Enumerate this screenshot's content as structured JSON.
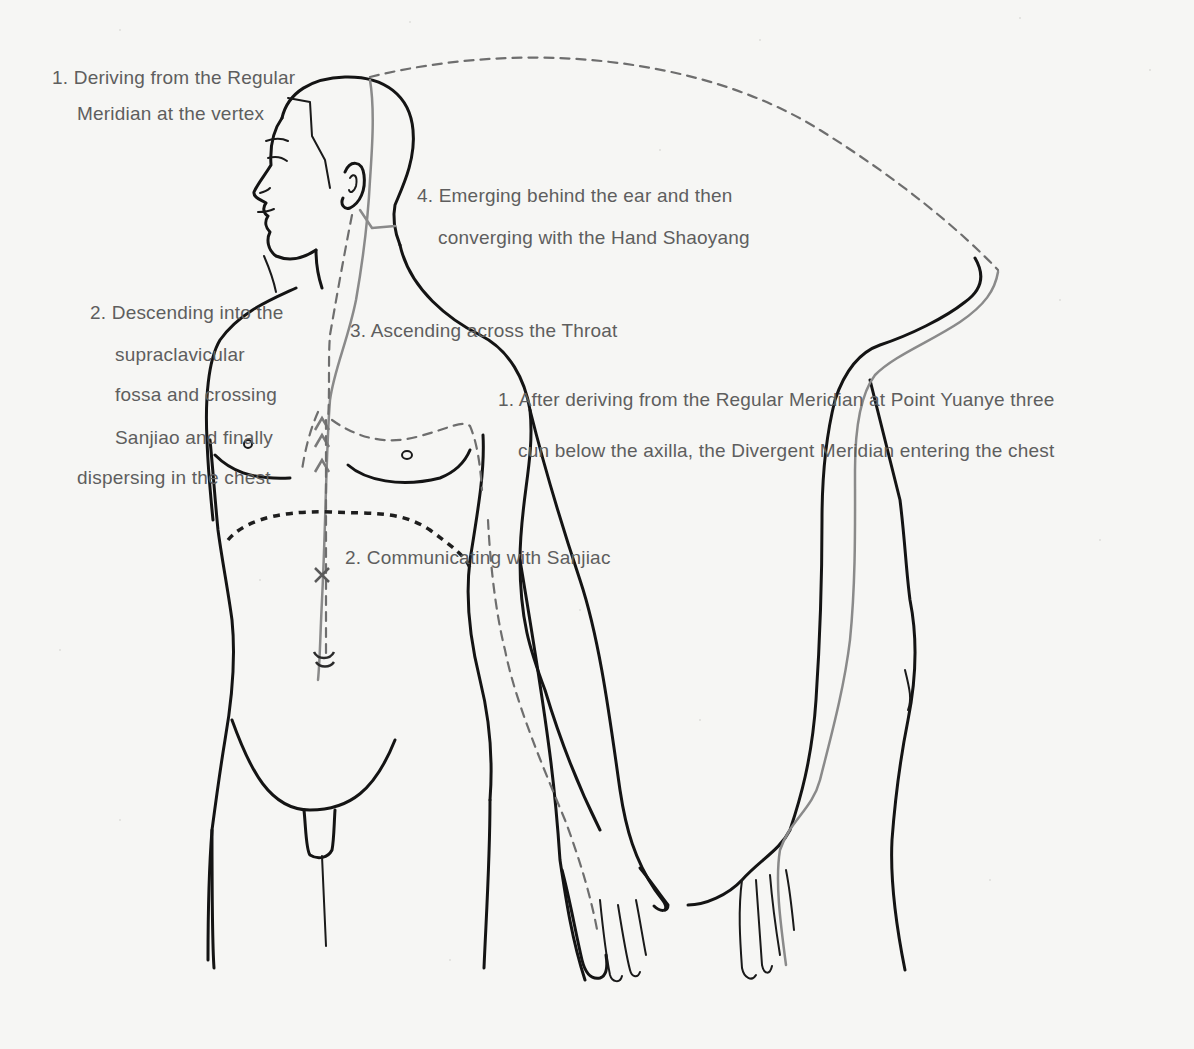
{
  "diagram": {
    "colors": {
      "paper": "#f6f6f4",
      "outline": "#141414",
      "meridian_gray": "#8a8a8a",
      "dashed_path": "#6e6e6e",
      "label_text": "#5e5e5e"
    },
    "labels": {
      "vertex_line1": "1. Deriving from the Regular",
      "vertex_line2": "Meridian at the vertex",
      "ear_line1": "4. Emerging behind the ear and then",
      "ear_line2": "converging with the Hand Shaoyang",
      "descending_line1": "2. Descending into the",
      "descending_line2": "supraclavicular",
      "descending_line3": "fossa and crossing",
      "descending_line4": "Sanjiao and finally",
      "descending_line5": "dispersing in the chest",
      "throat": "3. Ascending across the Throat",
      "axilla_line1": "1. After deriving from the Regular Meridian at Point Yuanye three",
      "axilla_line2": "cun below the axilla, the Divergent Meridian entering the chest",
      "sanjiao": "2. Communicating with Sanjiac"
    },
    "figures": [
      {
        "name": "front-torso-figure",
        "view": "front, head in profile"
      },
      {
        "name": "raised-arm-figure",
        "view": "arm raised overhead, side"
      }
    ]
  }
}
